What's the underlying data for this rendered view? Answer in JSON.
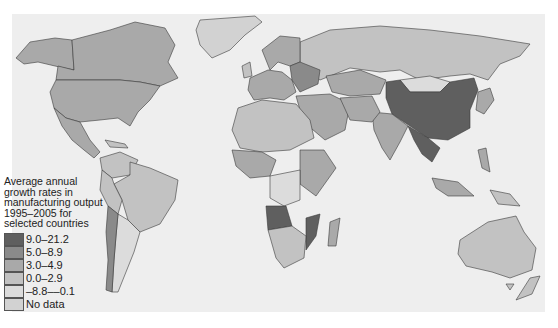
{
  "legend": {
    "title_lines": [
      "Average annual",
      "growth rates in",
      "manufacturing output",
      "1995–2005 for",
      "selected countries"
    ],
    "items": [
      {
        "label": "9.0–21.2",
        "color": "#5f5f5f"
      },
      {
        "label": "5.0–8.9",
        "color": "#8a8a8a"
      },
      {
        "label": "3.0–4.9",
        "color": "#a9a9a9"
      },
      {
        "label": "0.0–2.9",
        "color": "#c2c2c2"
      },
      {
        "label": "–8.8––0.1",
        "color": "#dcdcdc"
      },
      {
        "label": "No data",
        "color": "#d2d2d2"
      }
    ]
  },
  "regions": {
    "north_america": {
      "canada": "3.0–4.9",
      "usa": "3.0–4.9",
      "alaska": "3.0–4.9",
      "mexico": "3.0–4.9",
      "greenland": "No data"
    },
    "south_america": {
      "brazil": "0.0–2.9",
      "argentina": "0.0–2.9",
      "chile": "5.0–8.9",
      "colombia_venezuela": "0.0–2.9"
    },
    "europe_russia": {
      "russia": "0.0–2.9",
      "belarus_region": "5.0–8.9",
      "western_europe": "3.0–4.9"
    },
    "asia": {
      "china": "9.0–21.2",
      "india": "3.0–4.9",
      "kazakhstan": "3.0–4.9",
      "mongolia": "No data",
      "southeast_asia": "9.0–21.2"
    },
    "africa": {
      "angola": "9.0–21.2",
      "mozambique": "9.0–21.2",
      "north_africa": "0.0–2.9",
      "south_africa": "0.0–2.9"
    },
    "oceania": {
      "australia": "0.0–2.9",
      "new_zealand": "0.0–2.9"
    }
  }
}
